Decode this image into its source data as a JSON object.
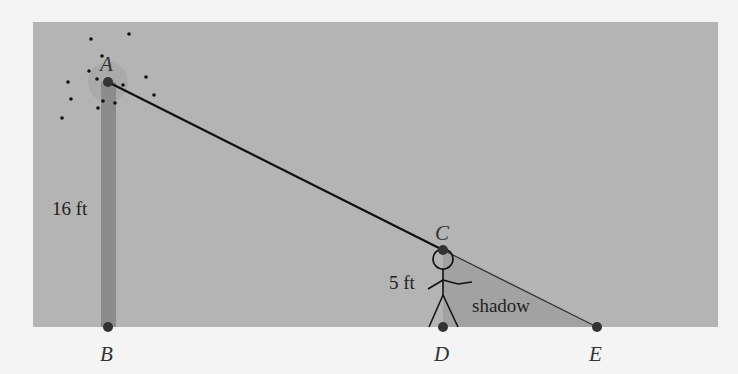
{
  "diagram": {
    "points": {
      "A": "A",
      "B": "B",
      "C": "C",
      "D": "D",
      "E": "E"
    },
    "lamp_height": "16 ft",
    "person_height": "5 ft",
    "shadow_label": "shadow",
    "colors": {
      "background": "#f4f4f4",
      "panel": "#b4b4b4",
      "pole": "#8a8a8a",
      "shadow": "#a4a4a4",
      "line": "#111111"
    }
  }
}
